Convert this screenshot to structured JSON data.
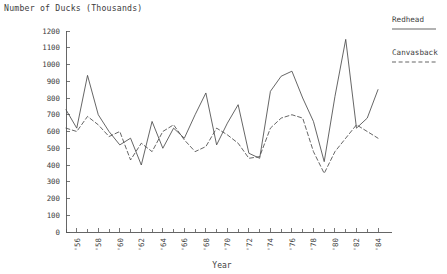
{
  "chart_data": {
    "type": "line",
    "title": "Number of Ducks (Thousands)",
    "xlabel": "Year",
    "ylabel": "",
    "ylim": [
      0,
      1200
    ],
    "ytick_step": 100,
    "yticks": [
      0,
      100,
      200,
      300,
      400,
      500,
      600,
      700,
      800,
      900,
      1000,
      1100,
      1200
    ],
    "xlim": [
      1955,
      1984
    ],
    "xticks_major": [
      "'56",
      "'58",
      "'60",
      "'62",
      "'64",
      "'66",
      "'68",
      "'70",
      "'72",
      "'74",
      "'76",
      "'78",
      "'80",
      "'82",
      "'84"
    ],
    "xticks_major_values": [
      1956,
      1958,
      1960,
      1962,
      1964,
      1966,
      1968,
      1970,
      1972,
      1974,
      1976,
      1978,
      1980,
      1982,
      1984
    ],
    "xticks_minor_values": [
      1955,
      1957,
      1959,
      1961,
      1963,
      1965,
      1967,
      1969,
      1971,
      1973,
      1975,
      1977,
      1979,
      1981,
      1983
    ],
    "grid": false,
    "legend_position": "right-top",
    "x": [
      1955,
      1956,
      1957,
      1958,
      1959,
      1960,
      1961,
      1962,
      1963,
      1964,
      1965,
      1966,
      1967,
      1968,
      1969,
      1970,
      1971,
      1972,
      1973,
      1974,
      1975,
      1976,
      1977,
      1978,
      1979,
      1980,
      1981,
      1982,
      1983,
      1984
    ],
    "series": [
      {
        "name": "Redhead",
        "style": "solid",
        "color": "#4a4a4a",
        "values": [
          730,
          620,
          935,
          700,
          600,
          520,
          560,
          400,
          660,
          500,
          620,
          560,
          700,
          830,
          520,
          650,
          760,
          470,
          440,
          840,
          930,
          960,
          800,
          660,
          420,
          810,
          1150,
          620,
          680,
          850
        ]
      },
      {
        "name": "Canvasback",
        "style": "dashed",
        "color": "#4a4a4a",
        "values": [
          620,
          600,
          690,
          640,
          570,
          600,
          430,
          530,
          480,
          600,
          640,
          550,
          480,
          510,
          620,
          580,
          530,
          440,
          450,
          620,
          680,
          700,
          680,
          480,
          350,
          480,
          560,
          640,
          600,
          560
        ]
      }
    ],
    "legend": [
      {
        "label": "Redhead",
        "style": "solid"
      },
      {
        "label": "Canvasback",
        "style": "dashed"
      }
    ]
  }
}
